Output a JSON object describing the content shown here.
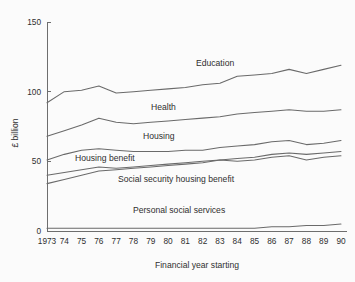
{
  "chart_data": {
    "type": "line",
    "title": "",
    "xlabel": "Financial year starting",
    "ylabel": "£ billion",
    "xlim": [
      1973,
      1990
    ],
    "ylim": [
      0,
      150
    ],
    "yticks": [
      0,
      50,
      100,
      150
    ],
    "ytick_labels": [
      "0",
      "50",
      "100",
      "150"
    ],
    "grid": false,
    "legend": "inline-labels",
    "x": [
      1973,
      1974,
      1975,
      1976,
      1977,
      1978,
      1979,
      1980,
      1981,
      1982,
      1983,
      1984,
      1985,
      1986,
      1987,
      1988,
      1989,
      1990
    ],
    "xtick_labels": [
      "1973",
      "74",
      "75",
      "76",
      "77",
      "78",
      "79",
      "80",
      "81",
      "82",
      "83",
      "84",
      "85",
      "86",
      "87",
      "88",
      "89",
      "90"
    ],
    "series": [
      {
        "name": "Education",
        "values": [
          92,
          100,
          101,
          104,
          99,
          100,
          101,
          102,
          103,
          105,
          106,
          111,
          112,
          113,
          116,
          113,
          116,
          119
        ]
      },
      {
        "name": "Health",
        "values": [
          68,
          72,
          76,
          81,
          78,
          77,
          78,
          79,
          80,
          81,
          82,
          84,
          85,
          86,
          87,
          86,
          86,
          87
        ]
      },
      {
        "name": "Housing",
        "values": [
          51,
          55,
          58,
          59,
          58,
          57,
          57,
          57,
          58,
          58,
          60,
          61,
          62,
          64,
          65,
          62,
          63,
          65
        ]
      },
      {
        "name": "Housing benefit",
        "values": [
          40,
          42,
          44,
          46,
          45,
          46,
          47,
          48,
          49,
          50,
          51,
          52,
          53,
          55,
          56,
          55,
          56,
          57
        ]
      },
      {
        "name": "Social security housing benefit",
        "values": [
          34,
          37,
          40,
          43,
          44,
          45,
          46,
          47,
          48,
          49,
          51,
          50,
          51,
          53,
          54,
          51,
          53,
          54
        ]
      },
      {
        "name": "Personal social services",
        "values": [
          2,
          2,
          2,
          2,
          2,
          2,
          2,
          2,
          2,
          2,
          2,
          2,
          2,
          3,
          3,
          4,
          4,
          5
        ]
      }
    ],
    "series_label_positions": [
      {
        "name": "Education",
        "x": 196,
        "y": 66
      },
      {
        "name": "Health",
        "x": 151,
        "y": 110
      },
      {
        "name": "Housing",
        "x": 143,
        "y": 139
      },
      {
        "name": "Housing benefit",
        "x": 75,
        "y": 161
      },
      {
        "name": "Social security housing benefit",
        "x": 118,
        "y": 182
      },
      {
        "name": "Personal social services",
        "x": 133,
        "y": 213
      }
    ],
    "colors": {
      "line": "#6a6a6a",
      "axis": "#6e6e6e",
      "text": "#2f2f2f",
      "background": "#fbfbfb"
    }
  }
}
